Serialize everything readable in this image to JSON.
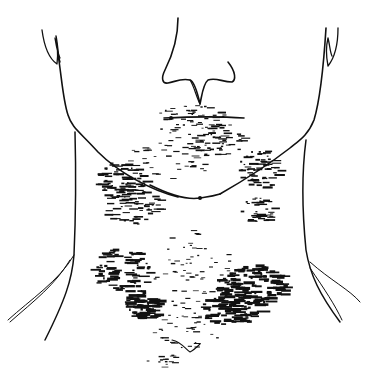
{
  "figure": {
    "ink_color": "#111111",
    "background_color": "#ffffff",
    "regions": [
      {
        "name": "perioral",
        "density": "light"
      },
      {
        "name": "submandibular-left",
        "density": "medium"
      },
      {
        "name": "submandibular-right",
        "density": "medium"
      },
      {
        "name": "lower-neck-left",
        "density": "heavy"
      },
      {
        "name": "lower-neck-right",
        "density": "heavy"
      }
    ]
  }
}
